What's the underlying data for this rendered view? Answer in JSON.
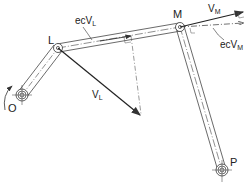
{
  "diagram": {
    "colors": {
      "line": "#333333",
      "background": "#ffffff"
    },
    "points": {
      "O": {
        "label": "O",
        "x": 22,
        "y": 95
      },
      "L": {
        "label": "L",
        "x": 58,
        "y": 48
      },
      "M": {
        "label": "M",
        "x": 180,
        "y": 27
      },
      "P": {
        "label": "P",
        "x": 222,
        "y": 170
      }
    },
    "links": [
      {
        "name": "crank-OL",
        "from": "O",
        "to": "L"
      },
      {
        "name": "coupler-LM",
        "from": "L",
        "to": "M"
      },
      {
        "name": "rocker-MP",
        "from": "M",
        "to": "P"
      }
    ],
    "vectors": {
      "VL": {
        "label_main": "V",
        "label_sub": "L",
        "from": "L",
        "to": [
          140,
          115
        ]
      },
      "VM": {
        "label_main": "V",
        "label_sub": "M",
        "from": "M",
        "to": [
          243,
          12
        ]
      },
      "ecVL": {
        "label_main": "ecV",
        "label_sub": "L"
      },
      "ecVM": {
        "label_main": "ecV",
        "label_sub": "M",
        "from": "M",
        "to": [
          243,
          24
        ]
      }
    },
    "rotation_arrow": "counterclockwise-arrow"
  }
}
